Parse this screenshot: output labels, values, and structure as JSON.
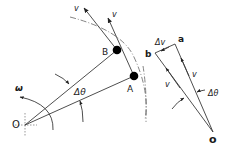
{
  "diagram": {
    "left_figure": {
      "points": {
        "O": {
          "label": "O",
          "x": 25,
          "y": 125
        },
        "A": {
          "label": "A",
          "x": 134,
          "y": 76
        },
        "B": {
          "label": "B",
          "x": 117,
          "y": 50
        }
      },
      "labels": {
        "omega": "ω",
        "delta_theta": "Δθ",
        "v_at_B": "v",
        "v_at_A": "v",
        "point_O": "O",
        "point_A": "A",
        "point_B": "B"
      }
    },
    "right_figure": {
      "points": {
        "o": {
          "label": "o",
          "x": 213,
          "y": 132
        },
        "a": {
          "label": "a",
          "x": 175,
          "y": 44
        },
        "b": {
          "label": "b",
          "x": 155,
          "y": 53
        }
      },
      "labels": {
        "delta_v": "Δv",
        "v_oa": "v",
        "v_ob": "v",
        "delta_theta": "Δθ",
        "point_o": "o",
        "point_a": "a",
        "point_b": "b"
      }
    },
    "colors": {
      "line": "#3a3a3a",
      "text": "#1a1a1a",
      "dot": "#000000",
      "background": "#ffffff"
    }
  }
}
